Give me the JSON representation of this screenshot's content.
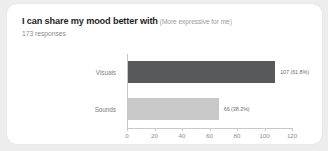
{
  "card": {
    "title_main": "I can share my mood better with",
    "title_sub": "(More expressive for me)",
    "responses": "173 responses"
  },
  "chart_data": {
    "type": "bar",
    "orientation": "horizontal",
    "subtitle": "173 responses",
    "xlabel": "",
    "ylabel": "",
    "xlim": [
      0,
      120
    ],
    "grid": false,
    "legend": false,
    "total_responses": 173,
    "xticks": [
      0,
      20,
      40,
      60,
      80,
      100,
      120
    ],
    "xtick_labels": [
      "0",
      "20",
      "40",
      "60",
      "80",
      "100",
      "120"
    ],
    "categories": [
      "Visuals",
      "Sounds"
    ],
    "values": [
      107,
      66
    ],
    "percents": [
      61.8,
      38.2
    ],
    "data_labels": [
      "107 (61.8%)",
      "66 (38.2%)"
    ],
    "colors": [
      "#58595b",
      "#c8c8c8"
    ]
  },
  "colors": {
    "page_background": "#ededed",
    "card_background": "#ffffff",
    "bar_dark": "#58595b",
    "bar_light": "#c8c8c8",
    "axis": "#c9c9c9",
    "title_text": "#1f1f1f",
    "muted_text": "#8d8d8d"
  }
}
